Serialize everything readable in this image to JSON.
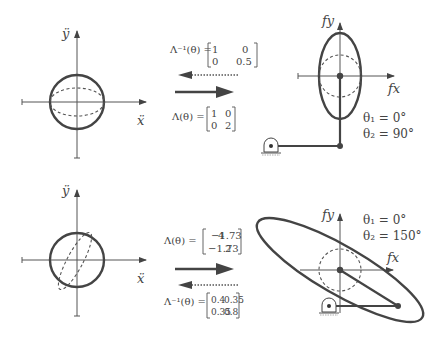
{
  "figure": {
    "top": {
      "input_space": {
        "y_axis_label": "ÿ",
        "x_axis_label": "ẍ",
        "shape": "unit circle with dashed ellipse (compressed vertically)"
      },
      "inverse_map": {
        "lhs": "Λ⁻¹(θ) =",
        "matrix": [
          [
            "1",
            "0"
          ],
          [
            "0",
            "0.5"
          ]
        ],
        "arrow": "dotted-left"
      },
      "forward_map": {
        "lhs": "Λ(θ) =",
        "matrix": [
          [
            "1",
            "0"
          ],
          [
            "0",
            "2"
          ]
        ],
        "arrow": "solid-right"
      },
      "output_space": {
        "y_axis_label": "fy",
        "x_axis_label": "fx",
        "theta1": "θ₁ = 0°",
        "theta2": "θ₂ = 90°",
        "shape": "vertical ellipse with dashed circle, two-link arm"
      }
    },
    "bottom": {
      "input_space": {
        "y_axis_label": "ÿ",
        "x_axis_label": "ẍ",
        "shape": "unit circle with dashed tilted ellipse"
      },
      "forward_map": {
        "lhs": "Λ(θ) =",
        "matrix": [
          [
            "4",
            "−1.73"
          ],
          [
            "−1.73",
            "2"
          ]
        ],
        "arrow": "solid-right"
      },
      "inverse_map": {
        "lhs": "Λ⁻¹(θ) =",
        "matrix": [
          [
            "0.4",
            "0.35"
          ],
          [
            "0.35",
            "0.8"
          ]
        ],
        "arrow": "dotted-left"
      },
      "output_space": {
        "y_axis_label": "fy",
        "x_axis_label": "fx",
        "theta1": "θ₁ = 0°",
        "theta2": "θ₂ = 150°",
        "shape": "tilted elongated ellipse with dashed circle, two-link arm"
      }
    }
  }
}
